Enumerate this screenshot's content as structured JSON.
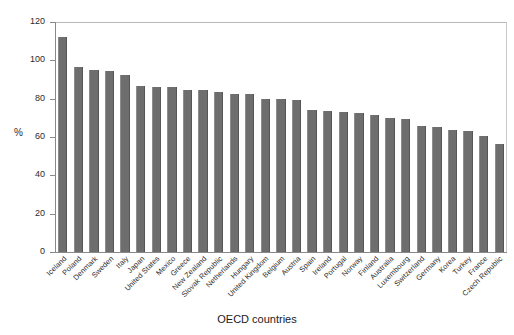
{
  "chart_data": {
    "type": "bar",
    "title": "",
    "xlabel": "OECD countries",
    "ylabel": "%",
    "ylim": [
      0,
      120
    ],
    "yticks": [
      0,
      20,
      40,
      60,
      80,
      100,
      120
    ],
    "grid": false,
    "legend": null,
    "bar_color": "#6e6e6e",
    "categories": [
      "Iceland",
      "Poland",
      "Denmark",
      "Sweden",
      "Italy",
      "Japan",
      "United States",
      "Mexico",
      "Greece",
      "New Zealand",
      "Slovak Republic",
      "Netherlands",
      "Hungary",
      "United Kingdom",
      "Belgium",
      "Austria",
      "Spain",
      "Ireland",
      "Portugal",
      "Norway",
      "Finland",
      "Australia",
      "Luxembourg",
      "Switzerland",
      "Germany",
      "Korea",
      "Turkey",
      "France",
      "Czech Republic"
    ],
    "values": [
      112,
      96.5,
      95,
      94.5,
      92.5,
      86.5,
      86,
      86,
      84.5,
      84.5,
      83.5,
      82.5,
      82.5,
      80,
      80,
      79.5,
      74,
      73.5,
      73,
      72.5,
      71.5,
      70,
      69.5,
      66,
      65,
      63.5,
      63,
      60.5,
      56.5
    ],
    "last_value_note": "54.5"
  },
  "axis": {
    "y_label": "%",
    "x_title": "OECD countries"
  }
}
